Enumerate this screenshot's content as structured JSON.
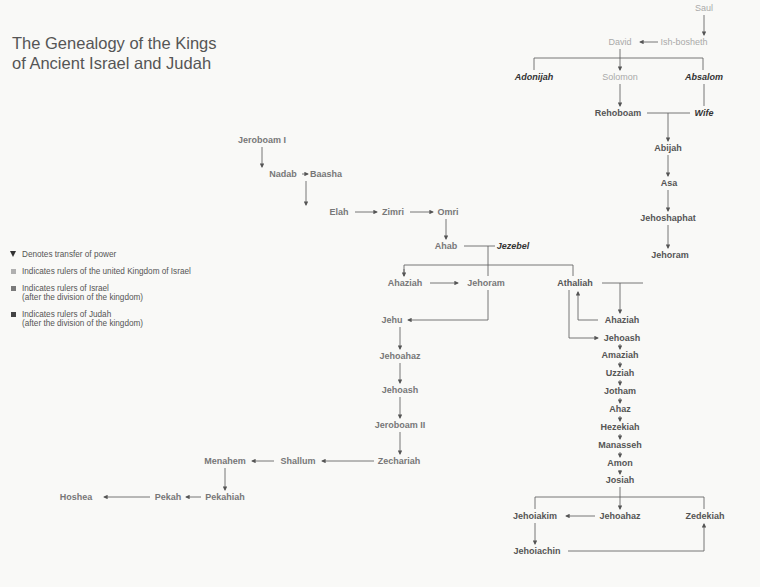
{
  "title": {
    "line1": "The Genealogy of the Kings",
    "line2": "of Ancient Israel and Judah"
  },
  "legend": {
    "items": [
      {
        "symbol": "triangle-down-icon",
        "label": "Denotes transfer of power",
        "sub": ""
      },
      {
        "symbol": "square-icon",
        "color": "#b0b0b0",
        "label": "Indicates rulers of the united Kingdom of Israel",
        "sub": ""
      },
      {
        "symbol": "square-icon",
        "color": "#7a7a7a",
        "label": "Indicates rulers of Israel",
        "sub": "(after the division of the kingdom)"
      },
      {
        "symbol": "square-icon",
        "color": "#444444",
        "label": "Indicates rulers of Judah",
        "sub": "(after the division of the kingdom)"
      }
    ]
  },
  "colors": {
    "united": "#a9a9a9",
    "israel": "#777777",
    "judah": "#555555",
    "other": "#333333",
    "line": "#666666",
    "background": "#f9f9f7"
  },
  "nodes": {
    "saul": {
      "label": "Saul",
      "group": "united"
    },
    "david": {
      "label": "David",
      "group": "united"
    },
    "ishbosheth": {
      "label": "Ish-bosheth",
      "group": "united"
    },
    "adonijah": {
      "label": "Adonijah",
      "group": "other"
    },
    "solomon": {
      "label": "Solomon",
      "group": "united"
    },
    "absalom": {
      "label": "Absalom",
      "group": "other"
    },
    "rehoboam": {
      "label": "Rehoboam",
      "group": "judah"
    },
    "wife": {
      "label": "Wife",
      "group": "other"
    },
    "abijah": {
      "label": "Abijah",
      "group": "judah"
    },
    "asa": {
      "label": "Asa",
      "group": "judah"
    },
    "jehoshaphat": {
      "label": "Jehoshaphat",
      "group": "judah"
    },
    "jehoram_j": {
      "label": "Jehoram",
      "group": "judah"
    },
    "jeroboam1": {
      "label": "Jeroboam I",
      "group": "israel"
    },
    "nadab": {
      "label": "Nadab",
      "group": "israel"
    },
    "baasha": {
      "label": "Baasha",
      "group": "israel"
    },
    "elah": {
      "label": "Elah",
      "group": "israel"
    },
    "zimri": {
      "label": "Zimri",
      "group": "israel"
    },
    "omri": {
      "label": "Omri",
      "group": "israel"
    },
    "ahab": {
      "label": "Ahab",
      "group": "israel"
    },
    "jezebel": {
      "label": "Jezebel",
      "group": "other"
    },
    "ahaziah_i": {
      "label": "Ahaziah",
      "group": "israel"
    },
    "jehoram_i": {
      "label": "Jehoram",
      "group": "israel"
    },
    "athaliah": {
      "label": "Athaliah",
      "group": "judah"
    },
    "ahaziah_j": {
      "label": "Ahaziah",
      "group": "judah"
    },
    "jehoash_j": {
      "label": "Jehoash",
      "group": "judah"
    },
    "jehu": {
      "label": "Jehu",
      "group": "israel"
    },
    "jehoahaz_i": {
      "label": "Jehoahaz",
      "group": "israel"
    },
    "jehoash_i": {
      "label": "Jehoash",
      "group": "israel"
    },
    "jeroboam2": {
      "label": "Jeroboam II",
      "group": "israel"
    },
    "zechariah": {
      "label": "Zechariah",
      "group": "israel"
    },
    "shallum": {
      "label": "Shallum",
      "group": "israel"
    },
    "menahem": {
      "label": "Menahem",
      "group": "israel"
    },
    "pekahiah": {
      "label": "Pekahiah",
      "group": "israel"
    },
    "pekah": {
      "label": "Pekah",
      "group": "israel"
    },
    "hoshea": {
      "label": "Hoshea",
      "group": "israel"
    },
    "amaziah": {
      "label": "Amaziah",
      "group": "judah"
    },
    "uzziah": {
      "label": "Uzziah",
      "group": "judah"
    },
    "jotham": {
      "label": "Jotham",
      "group": "judah"
    },
    "ahaz": {
      "label": "Ahaz",
      "group": "judah"
    },
    "hezekiah": {
      "label": "Hezekiah",
      "group": "judah"
    },
    "manasseh": {
      "label": "Manasseh",
      "group": "judah"
    },
    "amon": {
      "label": "Amon",
      "group": "judah"
    },
    "josiah": {
      "label": "Josiah",
      "group": "judah"
    },
    "jehoiakim": {
      "label": "Jehoiakim",
      "group": "judah"
    },
    "jehoahaz_j": {
      "label": "Jehoahaz",
      "group": "judah"
    },
    "zedekiah": {
      "label": "Zedekiah",
      "group": "judah"
    },
    "jehoiachin": {
      "label": "Jehoiachin",
      "group": "judah"
    }
  }
}
